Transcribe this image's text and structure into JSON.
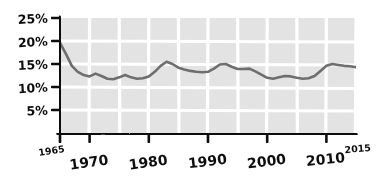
{
  "chart_data": {
    "type": "line",
    "title": "",
    "subtitle": "",
    "xlabel": "",
    "ylabel": "",
    "style": "hand-drawn-sketch",
    "grid": true,
    "legend": null,
    "xlim": [
      1965,
      2015
    ],
    "ylim": [
      0,
      25
    ],
    "y_tick_labels": [
      "25%",
      "20%",
      "15%",
      "10%",
      "5%"
    ],
    "y_tick_values": [
      25,
      20,
      15,
      10,
      5
    ],
    "x_tick_labels": [
      "1965",
      "1970",
      "1980",
      "1990",
      "2000",
      "2010",
      "2015"
    ],
    "x_tick_values": [
      1965,
      1970,
      1980,
      1990,
      2000,
      2010,
      2015
    ],
    "x_minor_gridline_values": [
      1970,
      1975,
      1980,
      1985,
      1990,
      1995,
      2000,
      2005,
      2010,
      2015
    ],
    "y_gridline_values": [
      5,
      10,
      15,
      20,
      25
    ],
    "colors": {
      "line": "#6e6e6e",
      "axis": "#111111",
      "plot_background": "#e3e3e3",
      "gridline": "#ffffff",
      "page_background": "#ffffff",
      "label": "#111111"
    },
    "series": [
      {
        "name": "rate",
        "x": [
          1965,
          1966,
          1967,
          1968,
          1969,
          1970,
          1971,
          1972,
          1973,
          1974,
          1975,
          1976,
          1977,
          1978,
          1979,
          1980,
          1981,
          1982,
          1983,
          1984,
          1985,
          1986,
          1987,
          1988,
          1989,
          1990,
          1991,
          1992,
          1993,
          1994,
          1995,
          1996,
          1997,
          1998,
          1999,
          2000,
          2001,
          2002,
          2003,
          2004,
          2005,
          2006,
          2007,
          2008,
          2009,
          2010,
          2011,
          2012,
          2013,
          2014,
          2015
        ],
        "values": [
          19.6,
          17.2,
          14.6,
          13.3,
          12.6,
          12.3,
          12.9,
          12.4,
          11.8,
          11.7,
          12.1,
          12.6,
          12.1,
          11.8,
          11.9,
          12.3,
          13.3,
          14.6,
          15.5,
          15.0,
          14.2,
          13.8,
          13.5,
          13.3,
          13.2,
          13.3,
          14.0,
          14.9,
          15.0,
          14.4,
          13.9,
          13.9,
          14.0,
          13.4,
          12.7,
          12.0,
          11.8,
          12.1,
          12.4,
          12.3,
          12.0,
          11.8,
          11.9,
          12.4,
          13.5,
          14.6,
          15.0,
          14.8,
          14.6,
          14.5,
          14.3
        ]
      }
    ]
  },
  "axes": {
    "y_ticks": [
      {
        "label": "25%",
        "value": 25
      },
      {
        "label": "20%",
        "value": 20
      },
      {
        "label": "15%",
        "value": 15
      },
      {
        "label": "10%",
        "value": 10
      },
      {
        "label": "5%",
        "value": 5
      }
    ],
    "x_ticks": [
      {
        "label": "1965",
        "value": 1965,
        "size": "small"
      },
      {
        "label": "1970",
        "value": 1970,
        "size": "large"
      },
      {
        "label": "1980",
        "value": 1980,
        "size": "large"
      },
      {
        "label": "1990",
        "value": 1990,
        "size": "large"
      },
      {
        "label": "2000",
        "value": 2000,
        "size": "large"
      },
      {
        "label": "2010",
        "value": 2010,
        "size": "large"
      },
      {
        "label": "2015",
        "value": 2015,
        "size": "small"
      }
    ]
  }
}
